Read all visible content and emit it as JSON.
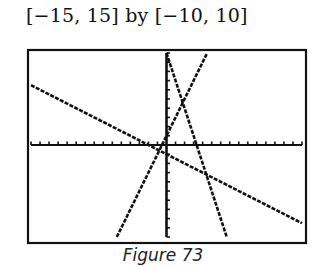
{
  "window": {
    "label": "[−15, 15] by [−10, 10]"
  },
  "caption": "Figure 73",
  "chart_data": {
    "type": "line",
    "title": "[−15, 15] by [−10, 10]",
    "xlabel": "",
    "ylabel": "",
    "xlim": [
      -15,
      15
    ],
    "ylim": [
      -10,
      10
    ],
    "xscl": 1,
    "yscl": 1,
    "grid": false,
    "legend": null,
    "annotations": [
      "Figure 73"
    ],
    "series": [
      {
        "name": "line-1",
        "equation": "y = -0.5x - 1",
        "slope": -0.5,
        "intercept": -1,
        "x": [
          -15,
          15
        ],
        "y": [
          6.5,
          -8.5
        ]
      },
      {
        "name": "line-2",
        "equation": "y = 2x + 1",
        "slope": 2,
        "intercept": 1,
        "x": [
          -5.5,
          4.5
        ],
        "y": [
          -10,
          10
        ]
      },
      {
        "name": "line-3",
        "equation": "y = -3x + 10",
        "slope": -3,
        "intercept": 10,
        "x": [
          0,
          6.667
        ],
        "y": [
          10,
          -10
        ]
      }
    ]
  },
  "style": {
    "ink": "#111111",
    "background": "#ffffff"
  }
}
